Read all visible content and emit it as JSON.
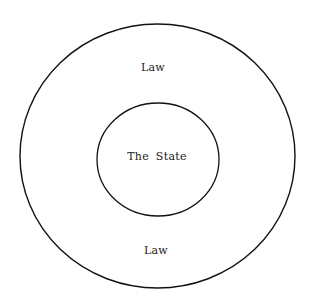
{
  "diagram": {
    "outer_circle": {
      "label_top": "Law",
      "label_bottom": "Law"
    },
    "inner_circle": {
      "label": "The State"
    },
    "colors": {
      "stroke": "#111111",
      "background": "#ffffff",
      "text": "#1a1a1a"
    }
  }
}
